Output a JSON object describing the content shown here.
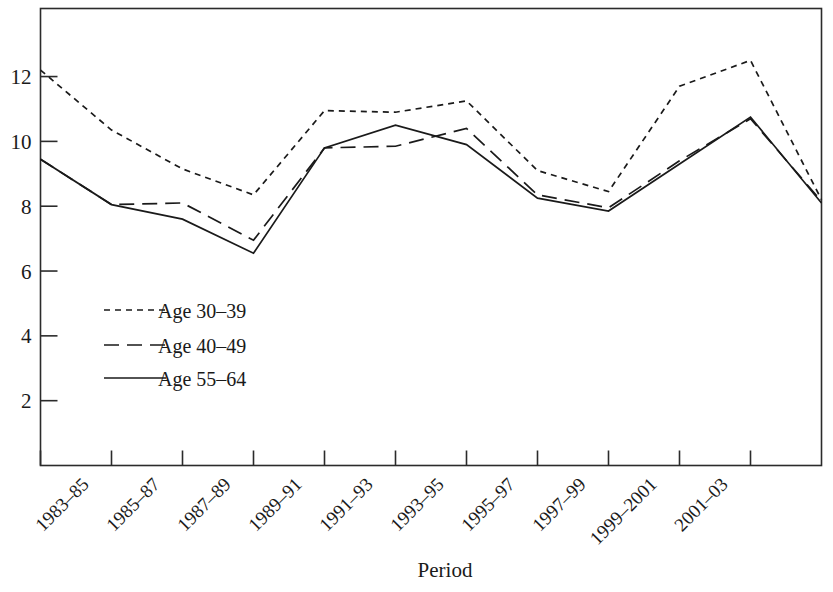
{
  "chart_data": {
    "type": "line",
    "title": "",
    "xlabel": "Period",
    "ylabel": "",
    "categories": [
      "1983–85",
      "1985–87",
      "1987–89",
      "1989–91",
      "1991–93",
      "1993–95",
      "1995–97",
      "1997–99",
      "1999–2001",
      "2001–03"
    ],
    "xtick_labels": [
      "1983–85",
      "1985–87",
      "1987–89",
      "1989–91",
      "1991–93",
      "1993–95",
      "1995–97",
      "1997–99",
      "1999–2001",
      "2001–03"
    ],
    "ytick_labels": [
      "2",
      "4",
      "6",
      "8",
      "10",
      "12"
    ],
    "ytick_values": [
      2,
      4,
      6,
      8,
      10,
      12
    ],
    "ylim": [
      0,
      14.1
    ],
    "xlim": [
      -0.5,
      10.5
    ],
    "grid": false,
    "legend_position": "inside-lower-left",
    "series": [
      {
        "name": "Age 30–39",
        "dash": "short-dash",
        "x": [
          -0.5,
          0.5,
          1.5,
          2.5,
          3.5,
          4.5,
          5.5,
          6.5,
          7.5,
          8.5,
          9.5,
          10.5
        ],
        "values": [
          12.2,
          10.35,
          9.15,
          8.35,
          10.95,
          10.9,
          11.25,
          9.1,
          8.45,
          11.7,
          12.5,
          8.2
        ]
      },
      {
        "name": "Age 40–49",
        "dash": "long-dash",
        "x": [
          -0.5,
          0.5,
          1.5,
          2.5,
          3.5,
          4.5,
          5.5,
          6.5,
          7.5,
          8.5,
          9.5,
          10.5
        ],
        "values": [
          9.45,
          8.05,
          8.1,
          6.95,
          9.8,
          9.85,
          10.4,
          8.35,
          7.95,
          9.4,
          10.7,
          8.15
        ]
      },
      {
        "name": "Age 55–64",
        "dash": "solid",
        "x": [
          -0.5,
          0.5,
          1.5,
          2.5,
          3.5,
          4.5,
          5.5,
          6.5,
          7.5,
          8.5,
          9.5,
          10.5
        ],
        "values": [
          9.45,
          8.05,
          7.6,
          6.55,
          9.8,
          10.5,
          9.9,
          8.25,
          7.85,
          9.3,
          10.75,
          8.1
        ]
      }
    ],
    "legend": [
      {
        "label": "Age 30–39",
        "dash": "short-dash"
      },
      {
        "label": "Age 40–49",
        "dash": "long-dash"
      },
      {
        "label": "Age 55–64",
        "dash": "solid"
      }
    ],
    "line_color": "#1a1a1a"
  }
}
